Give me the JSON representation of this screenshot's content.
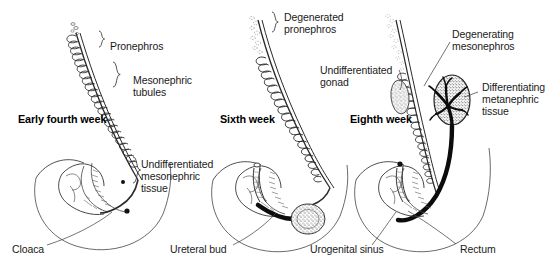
{
  "figure": {
    "type": "embryology-diagram",
    "background_color": "#ffffff",
    "ink_color": "#1a1a1a"
  },
  "panels": [
    {
      "id": "panel-early-fourth-week",
      "stage_label": "Early fourth week",
      "stage_label_x": 18,
      "stage_label_y": 113,
      "labels": [
        {
          "id": "pronephros",
          "text": "Pronephros",
          "x": 110,
          "y": 40,
          "lines": [
            "Pronephros"
          ]
        },
        {
          "id": "mesonephric-tubules",
          "text": "Mesonephric tubules",
          "x": 133,
          "y": 80,
          "lines": [
            "Mesonephric",
            "tubules"
          ]
        },
        {
          "id": "undifferentiated-mesonephric-tissue",
          "text": "Undifferentiated mesonephric tissue",
          "x": 140,
          "y": 160,
          "lines": [
            "Undifferentiated",
            "mesonephric",
            "tissue"
          ]
        },
        {
          "id": "cloaca",
          "text": "Cloaca",
          "x": 12,
          "y": 249,
          "lines": [
            "Cloaca"
          ]
        }
      ]
    },
    {
      "id": "panel-sixth-week",
      "stage_label": "Sixth week",
      "stage_label_x": 220,
      "stage_label_y": 113,
      "labels": [
        {
          "id": "degenerated-pronephros",
          "text": "Degenerated pronephros",
          "x": 283,
          "y": 13,
          "lines": [
            "Degenerated",
            "pronephros"
          ]
        },
        {
          "id": "ureteral-bud",
          "text": "Ureteral bud",
          "x": 170,
          "y": 249,
          "lines": [
            "Ureteral bud"
          ]
        }
      ]
    },
    {
      "id": "panel-eighth-week",
      "stage_label": "Eighth week",
      "stage_label_x": 350,
      "stage_label_y": 113,
      "labels": [
        {
          "id": "undifferentiated-gonad",
          "text": "Undifferentiated gonad",
          "x": 320,
          "y": 66,
          "lines": [
            "Undifferentiated",
            "gonad"
          ]
        },
        {
          "id": "degenerating-mesonephros",
          "text": "Degenerating mesonephros",
          "x": 452,
          "y": 30,
          "lines": [
            "Degenerating",
            "mesonephros"
          ]
        },
        {
          "id": "differentiating-metanephric-tissue",
          "text": "Differentiating metanephric tissue",
          "x": 481,
          "y": 83,
          "lines": [
            "Differentiating",
            "metanephric",
            "tissue"
          ]
        },
        {
          "id": "urogenital-sinus",
          "text": "Urogenital sinus",
          "x": 310,
          "y": 249,
          "lines": [
            "Urogenital sinus"
          ]
        },
        {
          "id": "rectum",
          "text": "Rectum",
          "x": 460,
          "y": 249,
          "lines": [
            "Rectum"
          ]
        }
      ]
    }
  ]
}
